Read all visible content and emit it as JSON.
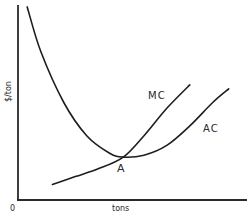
{
  "chart_data": {
    "type": "line",
    "title": "",
    "xlabel": "tons",
    "ylabel": "$/ton",
    "origin_label": "0",
    "xlim": [
      0,
      10
    ],
    "ylim": [
      0,
      10
    ],
    "grid": false,
    "legend": "none",
    "series": [
      {
        "name": "AC",
        "label": "AC",
        "description": "U-shaped average cost curve",
        "x": [
          0.4,
          1.0,
          2.0,
          3.0,
          4.0,
          4.6,
          5.5,
          6.5,
          7.5,
          8.5,
          9.2
        ],
        "y": [
          9.9,
          7.6,
          5.0,
          3.3,
          2.4,
          2.2,
          2.3,
          2.8,
          3.8,
          5.0,
          5.7
        ]
      },
      {
        "name": "MC",
        "label": "MC",
        "description": "upward sloping marginal cost curve crossing AC at its minimum",
        "x": [
          1.5,
          2.5,
          3.5,
          4.6,
          5.5,
          6.5,
          7.5
        ],
        "y": [
          0.8,
          1.2,
          1.6,
          2.2,
          3.3,
          4.7,
          5.9
        ]
      }
    ],
    "annotations": [
      {
        "label": "A",
        "x": 4.6,
        "y": 2.2,
        "note": "intersection of MC and AC at minimum AC"
      }
    ]
  }
}
